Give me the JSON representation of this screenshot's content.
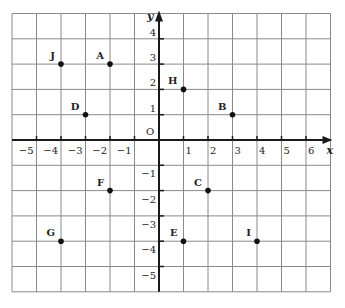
{
  "chart_data": {
    "type": "scatter",
    "title": "",
    "xlabel": "x",
    "ylabel": "y",
    "origin_label": "O",
    "xlim": [
      -6,
      7
    ],
    "ylim": [
      -6,
      5
    ],
    "grid": true,
    "x_ticks": [
      -5,
      -4,
      -3,
      -2,
      -1,
      1,
      2,
      3,
      4,
      5,
      6
    ],
    "y_ticks": [
      4,
      3,
      2,
      1,
      -1,
      -2,
      -3,
      -4,
      -5
    ],
    "x_tick_labels": [
      "−5",
      "−4",
      "−3",
      "−2",
      "−1",
      "1",
      "2",
      "3",
      "4",
      "5",
      "6"
    ],
    "y_tick_labels": [
      "4",
      "3",
      "2",
      "1",
      "−1",
      "−2",
      "−3",
      "−4",
      "−5"
    ],
    "points": [
      {
        "label": "J",
        "x": -4,
        "y": 3
      },
      {
        "label": "A",
        "x": -2,
        "y": 3
      },
      {
        "label": "H",
        "x": 1,
        "y": 2
      },
      {
        "label": "D",
        "x": -3,
        "y": 1
      },
      {
        "label": "B",
        "x": 3,
        "y": 1
      },
      {
        "label": "F",
        "x": -2,
        "y": -2
      },
      {
        "label": "C",
        "x": 2,
        "y": -2
      },
      {
        "label": "G",
        "x": -4,
        "y": -4
      },
      {
        "label": "E",
        "x": 1,
        "y": -4
      },
      {
        "label": "I",
        "x": 4,
        "y": -4
      }
    ]
  },
  "colors": {
    "grid": "#8a8a8a",
    "axis": "#1a1a1a",
    "point": "#111111",
    "background": "#ffffff"
  }
}
